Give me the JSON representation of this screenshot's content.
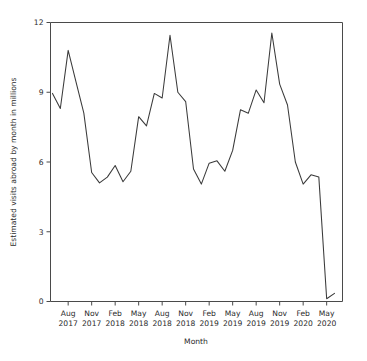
{
  "chart_data": {
    "type": "line",
    "title": "",
    "xlabel": "Month",
    "ylabel": "Estimated visits abroad by month in millions",
    "ylim": [
      0,
      12
    ],
    "yticks": [
      0,
      3,
      6,
      9,
      12
    ],
    "ytick_labels": [
      "0",
      "3",
      "6",
      "9",
      "12"
    ],
    "grid": false,
    "legend": "none",
    "xtick_labels": [
      {
        "month": "Aug",
        "year": "2017"
      },
      {
        "month": "Nov",
        "year": "2017"
      },
      {
        "month": "Feb",
        "year": "2018"
      },
      {
        "month": "May",
        "year": "2018"
      },
      {
        "month": "Aug",
        "year": "2018"
      },
      {
        "month": "Nov",
        "year": "2018"
      },
      {
        "month": "Feb",
        "year": "2019"
      },
      {
        "month": "May",
        "year": "2019"
      },
      {
        "month": "Aug",
        "year": "2019"
      },
      {
        "month": "Nov",
        "year": "2019"
      },
      {
        "month": "Feb",
        "year": "2020"
      },
      {
        "month": "May",
        "year": "2020"
      }
    ],
    "x": [
      "Jun 2017",
      "Jul 2017",
      "Aug 2017",
      "Sep 2017",
      "Oct 2017",
      "Nov 2017",
      "Dec 2017",
      "Jan 2018",
      "Feb 2018",
      "Mar 2018",
      "Apr 2018",
      "May 2018",
      "Jun 2018",
      "Jul 2018",
      "Aug 2018",
      "Sep 2018",
      "Oct 2018",
      "Nov 2018",
      "Dec 2018",
      "Jan 2019",
      "Feb 2019",
      "Mar 2019",
      "Apr 2019",
      "May 2019",
      "Jun 2019",
      "Jul 2019",
      "Aug 2019",
      "Sep 2019",
      "Oct 2019",
      "Nov 2019",
      "Dec 2019",
      "Jan 2020",
      "Feb 2020",
      "Mar 2020",
      "Apr 2020",
      "May 2020",
      "Jun 2020"
    ],
    "values": [
      8.95,
      8.3,
      10.8,
      9.45,
      8.1,
      5.55,
      5.1,
      5.35,
      5.85,
      5.15,
      5.6,
      7.95,
      7.55,
      8.95,
      8.75,
      11.45,
      9.0,
      8.6,
      5.7,
      5.05,
      5.95,
      6.05,
      5.6,
      6.5,
      8.25,
      8.1,
      9.1,
      8.55,
      11.55,
      9.35,
      8.45,
      6.0,
      5.05,
      5.45,
      5.35,
      0.12,
      0.35
    ],
    "colors": {
      "line": "#3a3a3a",
      "axis": "#4a4a4a",
      "background": "#ffffff",
      "text": "#2b2b2b"
    }
  }
}
